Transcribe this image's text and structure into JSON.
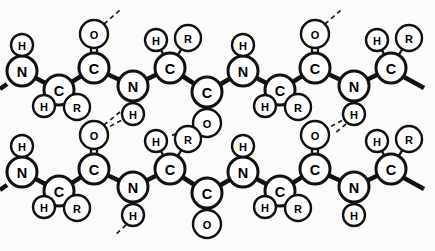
{
  "figure": {
    "name": "antiparallel-beta-sheet-diagram",
    "background_color": "#fbfbfa",
    "line_color": "#111111",
    "atom_fill": "#ffffff",
    "hydrogen_bond_style": "dashed"
  },
  "legend_symbols": {
    "N": "N",
    "C": "C",
    "O": "O",
    "H": "H",
    "R": "R"
  },
  "atoms": [
    {
      "id": "t-n1",
      "label": "N",
      "x": 22,
      "y": 71,
      "r": 15,
      "size": "big"
    },
    {
      "id": "t-h1",
      "label": "H",
      "x": 22,
      "y": 45,
      "r": 11,
      "size": "small"
    },
    {
      "id": "t-ca1",
      "label": "C",
      "x": 59,
      "y": 90,
      "r": 15,
      "size": "big"
    },
    {
      "id": "t-h2",
      "label": "H",
      "x": 44,
      "y": 106,
      "r": 11,
      "size": "small"
    },
    {
      "id": "t-r1",
      "label": "R",
      "x": 77,
      "y": 107,
      "r": 13,
      "size": "small"
    },
    {
      "id": "t-c1",
      "label": "C",
      "x": 94,
      "y": 68,
      "r": 15,
      "size": "big"
    },
    {
      "id": "t-o1",
      "label": "O",
      "x": 94,
      "y": 34,
      "r": 14,
      "size": "small"
    },
    {
      "id": "t-n2",
      "label": "N",
      "x": 133,
      "y": 86,
      "r": 15,
      "size": "big"
    },
    {
      "id": "t-h3",
      "label": "H",
      "x": 133,
      "y": 114,
      "r": 11,
      "size": "small"
    },
    {
      "id": "t-ca2",
      "label": "C",
      "x": 170,
      "y": 68,
      "r": 15,
      "size": "big"
    },
    {
      "id": "t-h4",
      "label": "H",
      "x": 156,
      "y": 40,
      "r": 11,
      "size": "small"
    },
    {
      "id": "t-r2",
      "label": "R",
      "x": 188,
      "y": 38,
      "r": 13,
      "size": "small"
    },
    {
      "id": "t-c2",
      "label": "C",
      "x": 207,
      "y": 92,
      "r": 15,
      "size": "big"
    },
    {
      "id": "t-o2",
      "label": "O",
      "x": 207,
      "y": 123,
      "r": 14,
      "size": "small"
    },
    {
      "id": "t-n3",
      "label": "N",
      "x": 243,
      "y": 71,
      "r": 15,
      "size": "big"
    },
    {
      "id": "t-h5",
      "label": "H",
      "x": 243,
      "y": 45,
      "r": 11,
      "size": "small"
    },
    {
      "id": "t-ca3",
      "label": "C",
      "x": 280,
      "y": 90,
      "r": 15,
      "size": "big"
    },
    {
      "id": "t-h6",
      "label": "H",
      "x": 265,
      "y": 106,
      "r": 11,
      "size": "small"
    },
    {
      "id": "t-r3",
      "label": "R",
      "x": 298,
      "y": 107,
      "r": 13,
      "size": "small"
    },
    {
      "id": "t-c3",
      "label": "C",
      "x": 315,
      "y": 68,
      "r": 15,
      "size": "big"
    },
    {
      "id": "t-o3",
      "label": "O",
      "x": 315,
      "y": 34,
      "r": 14,
      "size": "small"
    },
    {
      "id": "t-n4",
      "label": "N",
      "x": 354,
      "y": 86,
      "r": 15,
      "size": "big"
    },
    {
      "id": "t-h7",
      "label": "H",
      "x": 354,
      "y": 114,
      "r": 11,
      "size": "small"
    },
    {
      "id": "t-ca4",
      "label": "C",
      "x": 391,
      "y": 68,
      "r": 15,
      "size": "big"
    },
    {
      "id": "t-h8",
      "label": "H",
      "x": 377,
      "y": 40,
      "r": 11,
      "size": "small"
    },
    {
      "id": "t-r4",
      "label": "R",
      "x": 409,
      "y": 38,
      "r": 13,
      "size": "small"
    },
    {
      "id": "b-n1",
      "label": "N",
      "x": 22,
      "y": 172,
      "r": 15,
      "size": "big"
    },
    {
      "id": "b-h1",
      "label": "H",
      "x": 22,
      "y": 146,
      "r": 11,
      "size": "small"
    },
    {
      "id": "b-ca1",
      "label": "C",
      "x": 59,
      "y": 191,
      "r": 15,
      "size": "big"
    },
    {
      "id": "b-h2",
      "label": "H",
      "x": 44,
      "y": 207,
      "r": 11,
      "size": "small"
    },
    {
      "id": "b-r1",
      "label": "R",
      "x": 77,
      "y": 208,
      "r": 13,
      "size": "small"
    },
    {
      "id": "b-c1",
      "label": "C",
      "x": 94,
      "y": 169,
      "r": 15,
      "size": "big"
    },
    {
      "id": "b-o1",
      "label": "O",
      "x": 94,
      "y": 135,
      "r": 14,
      "size": "small"
    },
    {
      "id": "b-n2",
      "label": "N",
      "x": 133,
      "y": 187,
      "r": 15,
      "size": "big"
    },
    {
      "id": "b-h3",
      "label": "H",
      "x": 133,
      "y": 215,
      "r": 11,
      "size": "small"
    },
    {
      "id": "b-ca2",
      "label": "C",
      "x": 170,
      "y": 169,
      "r": 15,
      "size": "big"
    },
    {
      "id": "b-h4",
      "label": "H",
      "x": 156,
      "y": 141,
      "r": 11,
      "size": "small"
    },
    {
      "id": "b-r2",
      "label": "R",
      "x": 188,
      "y": 139,
      "r": 13,
      "size": "small"
    },
    {
      "id": "b-c2",
      "label": "C",
      "x": 207,
      "y": 193,
      "r": 15,
      "size": "big"
    },
    {
      "id": "b-o2",
      "label": "O",
      "x": 207,
      "y": 224,
      "r": 14,
      "size": "small"
    },
    {
      "id": "b-n3",
      "label": "N",
      "x": 243,
      "y": 172,
      "r": 15,
      "size": "big"
    },
    {
      "id": "b-h5",
      "label": "H",
      "x": 243,
      "y": 146,
      "r": 11,
      "size": "small"
    },
    {
      "id": "b-ca3",
      "label": "C",
      "x": 280,
      "y": 191,
      "r": 15,
      "size": "big"
    },
    {
      "id": "b-h6",
      "label": "H",
      "x": 265,
      "y": 207,
      "r": 11,
      "size": "small"
    },
    {
      "id": "b-r3",
      "label": "R",
      "x": 298,
      "y": 208,
      "r": 13,
      "size": "small"
    },
    {
      "id": "b-c3",
      "label": "C",
      "x": 315,
      "y": 169,
      "r": 15,
      "size": "big"
    },
    {
      "id": "b-o3",
      "label": "O",
      "x": 315,
      "y": 135,
      "r": 14,
      "size": "small"
    },
    {
      "id": "b-n4",
      "label": "N",
      "x": 354,
      "y": 187,
      "r": 15,
      "size": "big"
    },
    {
      "id": "b-h7",
      "label": "H",
      "x": 354,
      "y": 215,
      "r": 11,
      "size": "small"
    },
    {
      "id": "b-ca4",
      "label": "C",
      "x": 391,
      "y": 169,
      "r": 15,
      "size": "big"
    },
    {
      "id": "b-h8",
      "label": "H",
      "x": 377,
      "y": 141,
      "r": 11,
      "size": "small"
    },
    {
      "id": "b-r4",
      "label": "R",
      "x": 409,
      "y": 139,
      "r": 13,
      "size": "small"
    }
  ],
  "bonds": [
    {
      "from": "t-h1",
      "to": "t-n1",
      "kind": "thin"
    },
    {
      "from": "t-n1",
      "to": "t-ca1",
      "kind": "thick"
    },
    {
      "from": "t-ca1",
      "to": "t-h2",
      "kind": "thin"
    },
    {
      "from": "t-ca1",
      "to": "t-r1",
      "kind": "thin"
    },
    {
      "from": "t-ca1",
      "to": "t-c1",
      "kind": "thick"
    },
    {
      "from": "t-c1",
      "to": "t-o1",
      "kind": "double"
    },
    {
      "from": "t-c1",
      "to": "t-n2",
      "kind": "thick"
    },
    {
      "from": "t-n2",
      "to": "t-h3",
      "kind": "thin"
    },
    {
      "from": "t-n2",
      "to": "t-ca2",
      "kind": "thick"
    },
    {
      "from": "t-ca2",
      "to": "t-h4",
      "kind": "thin"
    },
    {
      "from": "t-ca2",
      "to": "t-r2",
      "kind": "thin"
    },
    {
      "from": "t-ca2",
      "to": "t-c2",
      "kind": "thick"
    },
    {
      "from": "t-c2",
      "to": "t-o2",
      "kind": "double"
    },
    {
      "from": "t-c2",
      "to": "t-n3",
      "kind": "thick"
    },
    {
      "from": "t-n3",
      "to": "t-h5",
      "kind": "thin"
    },
    {
      "from": "t-n3",
      "to": "t-ca3",
      "kind": "thick"
    },
    {
      "from": "t-ca3",
      "to": "t-h6",
      "kind": "thin"
    },
    {
      "from": "t-ca3",
      "to": "t-r3",
      "kind": "thin"
    },
    {
      "from": "t-ca3",
      "to": "t-c3",
      "kind": "thick"
    },
    {
      "from": "t-c3",
      "to": "t-o3",
      "kind": "double"
    },
    {
      "from": "t-c3",
      "to": "t-n4",
      "kind": "thick"
    },
    {
      "from": "t-n4",
      "to": "t-h7",
      "kind": "thin"
    },
    {
      "from": "t-n4",
      "to": "t-ca4",
      "kind": "thick"
    },
    {
      "from": "t-ca4",
      "to": "t-h8",
      "kind": "thin"
    },
    {
      "from": "t-ca4",
      "to": "t-r4",
      "kind": "thin"
    },
    {
      "from": "b-h1",
      "to": "b-n1",
      "kind": "thin"
    },
    {
      "from": "b-n1",
      "to": "b-ca1",
      "kind": "thick"
    },
    {
      "from": "b-ca1",
      "to": "b-h2",
      "kind": "thin"
    },
    {
      "from": "b-ca1",
      "to": "b-r1",
      "kind": "thin"
    },
    {
      "from": "b-ca1",
      "to": "b-c1",
      "kind": "thick"
    },
    {
      "from": "b-c1",
      "to": "b-o1",
      "kind": "double"
    },
    {
      "from": "b-c1",
      "to": "b-n2",
      "kind": "thick"
    },
    {
      "from": "b-n2",
      "to": "b-h3",
      "kind": "thin"
    },
    {
      "from": "b-n2",
      "to": "b-ca2",
      "kind": "thick"
    },
    {
      "from": "b-ca2",
      "to": "b-h4",
      "kind": "thin"
    },
    {
      "from": "b-ca2",
      "to": "b-r2",
      "kind": "thin"
    },
    {
      "from": "b-ca2",
      "to": "b-c2",
      "kind": "thick"
    },
    {
      "from": "b-c2",
      "to": "b-o2",
      "kind": "double"
    },
    {
      "from": "b-c2",
      "to": "b-n3",
      "kind": "thick"
    },
    {
      "from": "b-n3",
      "to": "b-h5",
      "kind": "thin"
    },
    {
      "from": "b-n3",
      "to": "b-ca3",
      "kind": "thick"
    },
    {
      "from": "b-ca3",
      "to": "b-h6",
      "kind": "thin"
    },
    {
      "from": "b-ca3",
      "to": "b-r3",
      "kind": "thin"
    },
    {
      "from": "b-ca3",
      "to": "b-c3",
      "kind": "thick"
    },
    {
      "from": "b-c3",
      "to": "b-o3",
      "kind": "double"
    },
    {
      "from": "b-c3",
      "to": "b-n4",
      "kind": "thick"
    },
    {
      "from": "b-n4",
      "to": "b-h7",
      "kind": "thin"
    },
    {
      "from": "b-n4",
      "to": "b-ca4",
      "kind": "thick"
    },
    {
      "from": "b-ca4",
      "to": "b-h8",
      "kind": "thin"
    },
    {
      "from": "b-ca4",
      "to": "b-r4",
      "kind": "thin"
    }
  ],
  "chain_stubs": [
    {
      "id": "stub-t-n1-left",
      "x1": 7,
      "y1": 84,
      "x2": 0,
      "y2": 89
    },
    {
      "id": "stub-t-ca4-right",
      "x1": 404,
      "y1": 77,
      "x2": 424,
      "y2": 88
    },
    {
      "id": "stub-b-n1-left",
      "x1": 7,
      "y1": 185,
      "x2": 0,
      "y2": 190
    },
    {
      "id": "stub-b-ca4-right",
      "x1": 404,
      "y1": 178,
      "x2": 424,
      "y2": 189
    }
  ],
  "dashed_stubs": [
    {
      "id": "dstub-t-o1-up",
      "x1": 104,
      "y1": 24,
      "x2": 120,
      "y2": 10
    },
    {
      "id": "dstub-t-o3-up",
      "x1": 325,
      "y1": 24,
      "x2": 341,
      "y2": 10
    },
    {
      "id": "dstub-t-h7-down",
      "x1": 346,
      "y1": 124,
      "x2": 334,
      "y2": 134
    },
    {
      "id": "dstub-b-h3-down",
      "x1": 126,
      "y1": 225,
      "x2": 114,
      "y2": 236
    },
    {
      "id": "dstub-b-h6-left",
      "x1": 254,
      "y1": 207,
      "x2": 266,
      "y2": 207
    },
    {
      "id": "dstub-b-o1-up",
      "x1": 104,
      "y1": 125,
      "x2": 120,
      "y2": 112
    },
    {
      "id": "dstub-b-h2-left",
      "x1": 33,
      "y1": 207,
      "x2": 45,
      "y2": 207
    },
    {
      "id": "dstub-t-h2-gap",
      "x1": 0,
      "y1": 0,
      "x2": 0,
      "y2": 0
    }
  ],
  "hydrogen_bonds": [
    {
      "id": "hbond-1",
      "from": "t-h3",
      "to": "b-o1",
      "x1": 126,
      "y1": 124,
      "x2": 103,
      "y2": 145
    },
    {
      "id": "hbond-2",
      "from": "t-o2",
      "to": "b-h4",
      "x1": 216,
      "y1": 132,
      "x2": 210,
      "y2": 139
    },
    {
      "id": "hbond-3",
      "from": "t-h7",
      "to": "b-o3",
      "x1": 347,
      "y1": 124,
      "x2": 324,
      "y2": 145
    }
  ],
  "caption": {
    "visible": false,
    "text": ""
  }
}
